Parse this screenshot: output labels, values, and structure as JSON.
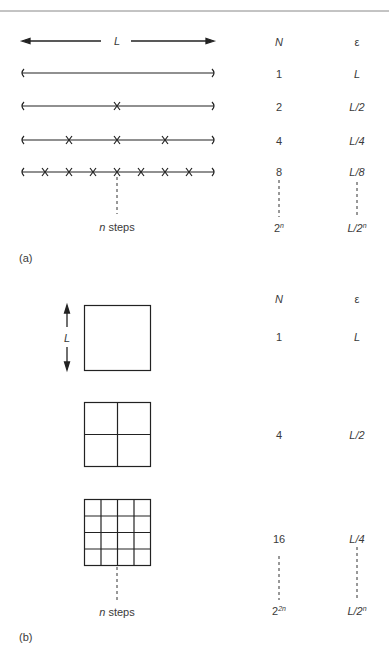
{
  "part_a": {
    "label": "(a)",
    "length_label": "L",
    "col_n_header": "N",
    "col_eps_header": "ε",
    "rows": [
      {
        "n": "1",
        "eps": "L",
        "crosses": 0
      },
      {
        "n": "2",
        "eps": "L/2",
        "crosses": 1
      },
      {
        "n": "4",
        "eps": "L/4",
        "crosses": 3
      },
      {
        "n": "8",
        "eps": "L/8",
        "crosses": 7
      }
    ],
    "steps_label_n": "n",
    "steps_label": "steps",
    "n_limit_base": "2",
    "n_limit_exp": "n",
    "eps_limit_base": "L/2",
    "eps_limit_exp": "n"
  },
  "part_b": {
    "label": "(b)",
    "length_label": "L",
    "col_n_header": "N",
    "col_eps_header": "ε",
    "rows": [
      {
        "n": "1",
        "eps": "L",
        "grid": 1
      },
      {
        "n": "4",
        "eps": "L/2",
        "grid": 2
      },
      {
        "n": "16",
        "eps": "L/4",
        "grid": 4
      }
    ],
    "steps_label_n": "n",
    "steps_label": "steps",
    "n_limit_base": "2",
    "n_limit_exp": "2n",
    "eps_limit_base": "L/2",
    "eps_limit_exp": "n"
  }
}
